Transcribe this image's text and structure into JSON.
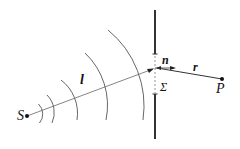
{
  "diagram": {
    "type": "diffraction-geometry",
    "labels": {
      "source": "S",
      "point": "P",
      "path_l": "l",
      "normal": "n",
      "distance_r": "r",
      "aperture": "Σ"
    },
    "colors": {
      "stroke": "#333333",
      "wavefront": "#555555",
      "ray": "#666666"
    }
  }
}
